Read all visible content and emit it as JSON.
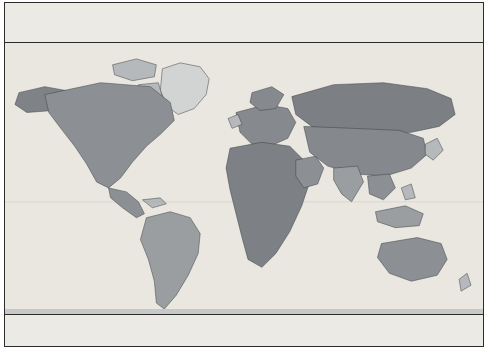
{
  "map": {
    "title": "World Time Zones Map",
    "date_line_label": "International Date Line",
    "gmt_note": "(GMT)",
    "colors": {
      "land_dark": "#8f9296",
      "land_mid": "#a8abad",
      "land_light": "#c9cbcb",
      "ocean": "#eceae4",
      "band_alt": "#dcd9d1",
      "grid": "#b9b7b0",
      "frame": "#2b2b2b"
    },
    "labels": [
      {
        "name": "arctic-ocean-west",
        "text": "ARCTIC\nOCEAN",
        "kind": "ocean",
        "x": 72,
        "y": 12
      },
      {
        "name": "arctic-ocean-east",
        "text": "ARCTIC\nOCEAN",
        "kind": "ocean",
        "x": 418,
        "y": 12
      },
      {
        "name": "north-america",
        "text": "NORTH\nAMERICA",
        "kind": "cont",
        "x": 102,
        "y": 85
      },
      {
        "name": "north-pacific-west",
        "text": "NORTH\nPACIFIC\nOCEAN",
        "kind": "ocean",
        "x": 42,
        "y": 98
      },
      {
        "name": "north-pacific-east",
        "text": "NORTH\nPACIFIC\nOCEAN",
        "kind": "ocean",
        "x": 409,
        "y": 95
      },
      {
        "name": "atlantic-ocean",
        "text": "ATLANTIC\nOCEAN",
        "kind": "ocean",
        "x": 177,
        "y": 105
      },
      {
        "name": "south-pacific-ocean",
        "text": "SOUTH\nPACIFIC\nOCEAN",
        "kind": "ocean",
        "x": 90,
        "y": 163
      },
      {
        "name": "south-america",
        "text": "SOUTH\nAMERICA",
        "kind": "cont",
        "x": 165,
        "y": 183
      },
      {
        "name": "europe",
        "text": "EUROPE",
        "kind": "cont",
        "x": 248,
        "y": 92
      },
      {
        "name": "africa",
        "text": "AFRICA",
        "kind": "cont",
        "x": 256,
        "y": 155
      },
      {
        "name": "asia",
        "text": "ASIA",
        "kind": "cont",
        "x": 356,
        "y": 78
      },
      {
        "name": "indian-ocean",
        "text": "INDIAN\nOCEAN",
        "kind": "ocean",
        "x": 336,
        "y": 198
      },
      {
        "name": "australia",
        "text": "AUSTRALIA",
        "kind": "cont",
        "x": 404,
        "y": 218
      }
    ],
    "half_hour_offsets": [
      {
        "name": "offset-plus-3-half",
        "text": "+3½",
        "x": 303,
        "y": 153
      },
      {
        "name": "offset-plus-4-half",
        "text": "+4½",
        "x": 319,
        "y": 152
      },
      {
        "name": "offset-plus-5-half",
        "text": "+5½",
        "x": 327,
        "y": 168
      },
      {
        "name": "offset-plus-6-half",
        "text": "+6½",
        "x": 335,
        "y": 177
      },
      {
        "name": "offset-plus-9-half",
        "text": "+9½",
        "x": 395,
        "y": 210
      }
    ]
  },
  "zones": [
    {
      "offset": "-11",
      "time": "1am",
      "sub": "",
      "longitude": "165°W",
      "hand": 30,
      "alt": false
    },
    {
      "offset": "-10",
      "time": "2am",
      "sub": "",
      "longitude": "150°W",
      "hand": 60,
      "alt": true
    },
    {
      "offset": "-9",
      "time": "3am",
      "sub": "",
      "longitude": "135°W",
      "hand": 90,
      "alt": false
    },
    {
      "offset": "-8",
      "time": "4am",
      "sub": "",
      "longitude": "120°W",
      "hand": 120,
      "alt": true
    },
    {
      "offset": "-7",
      "time": "5am",
      "sub": "",
      "longitude": "105°W",
      "hand": 150,
      "alt": false
    },
    {
      "offset": "-6",
      "time": "6am",
      "sub": "",
      "longitude": "90°W",
      "hand": 180,
      "alt": true
    },
    {
      "offset": "-5",
      "time": "7am",
      "sub": "",
      "longitude": "75°W",
      "hand": 210,
      "alt": false
    },
    {
      "offset": "-4",
      "time": "8am",
      "sub": "",
      "longitude": "60°W",
      "hand": 240,
      "alt": true
    },
    {
      "offset": "-3",
      "time": "9am",
      "sub": "",
      "longitude": "45°W",
      "hand": 270,
      "alt": false
    },
    {
      "offset": "-2",
      "time": "10am",
      "sub": "",
      "longitude": "30°W",
      "hand": 300,
      "alt": true
    },
    {
      "offset": "-1",
      "time": "11am",
      "sub": "",
      "longitude": "15°W",
      "hand": 330,
      "alt": false
    },
    {
      "offset": "0",
      "time": "Noon",
      "sub": "(GMT)",
      "longitude": "0°",
      "hand": 0,
      "alt": true
    },
    {
      "offset": "+1",
      "time": "1pm",
      "sub": "",
      "longitude": "15°E",
      "hand": 30,
      "alt": false
    },
    {
      "offset": "+2",
      "time": "2pm",
      "sub": "",
      "longitude": "30°E",
      "hand": 60,
      "alt": true
    },
    {
      "offset": "+3",
      "time": "3pm",
      "sub": "",
      "longitude": "45°E",
      "hand": 90,
      "alt": false
    },
    {
      "offset": "+4",
      "time": "4pm",
      "sub": "",
      "longitude": "60°E",
      "hand": 120,
      "alt": true
    },
    {
      "offset": "+5",
      "time": "5pm",
      "sub": "",
      "longitude": "75°E",
      "hand": 150,
      "alt": false
    },
    {
      "offset": "+6",
      "time": "6pm",
      "sub": "",
      "longitude": "90°E",
      "hand": 180,
      "alt": true
    },
    {
      "offset": "+7",
      "time": "7pm",
      "sub": "",
      "longitude": "105°E",
      "hand": 210,
      "alt": false
    },
    {
      "offset": "+8",
      "time": "8pm",
      "sub": "",
      "longitude": "120°E",
      "hand": 240,
      "alt": true
    },
    {
      "offset": "+9",
      "time": "9pm",
      "sub": "",
      "longitude": "135°E",
      "hand": 270,
      "alt": false
    },
    {
      "offset": "+10",
      "time": "10pm",
      "sub": "",
      "longitude": "150°E",
      "hand": 300,
      "alt": true
    },
    {
      "offset": "+11",
      "time": "11pm",
      "sub": "",
      "longitude": "165°E",
      "hand": 330,
      "alt": false
    },
    {
      "offset": "+12|-12",
      "time": "Midnight",
      "sub": "",
      "longitude": "180°E",
      "hand": 0,
      "alt": true
    }
  ]
}
